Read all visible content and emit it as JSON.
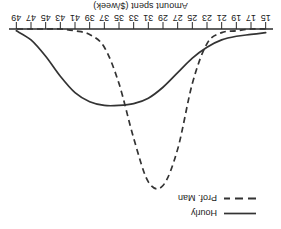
{
  "chart_data": {
    "type": "line",
    "title": "",
    "xlabel": "Amount spent ($/week)",
    "ylabel": "",
    "xlim": [
      14,
      50
    ],
    "ylim": [
      0,
      1
    ],
    "grid": false,
    "orientation": "rotated-180",
    "legend_position": "upper-left",
    "tick_labels": [
      "15",
      "17",
      "19",
      "21",
      "23",
      "25",
      "27",
      "29",
      "31",
      "33",
      "35",
      "37",
      "39",
      "41",
      "43",
      "45",
      "47",
      "49"
    ],
    "tick_values": [
      15,
      17,
      19,
      21,
      23,
      25,
      27,
      29,
      31,
      33,
      35,
      37,
      39,
      41,
      43,
      45,
      47,
      49
    ],
    "series": [
      {
        "name": "Hourly",
        "style": "solid",
        "color": "#333333",
        "peak_x": 38,
        "peak_y": 0.42,
        "x": [
          15,
          17,
          19,
          21,
          23,
          25,
          27,
          29,
          31,
          33,
          35,
          37,
          39,
          41,
          43,
          45,
          47,
          49
        ],
        "values": [
          0.02,
          0.03,
          0.04,
          0.06,
          0.1,
          0.16,
          0.24,
          0.32,
          0.38,
          0.41,
          0.42,
          0.42,
          0.4,
          0.35,
          0.26,
          0.15,
          0.06,
          0.01
        ]
      },
      {
        "name": "Prof. Man",
        "style": "dashed",
        "color": "#333333",
        "peak_x": 30,
        "peak_y": 0.86,
        "x": [
          15,
          17,
          19,
          21,
          23,
          25,
          27,
          29,
          31,
          33,
          35,
          37,
          39,
          41,
          43,
          45,
          47,
          49
        ],
        "values": [
          0.0,
          0.0,
          0.01,
          0.02,
          0.08,
          0.3,
          0.66,
          0.86,
          0.84,
          0.6,
          0.3,
          0.1,
          0.03,
          0.01,
          0.0,
          0.0,
          0.0,
          0.0
        ]
      }
    ]
  },
  "axis": {
    "title": "Amount spent ($/week)"
  },
  "legend": {
    "entries": [
      {
        "label": "Hourly",
        "style": "solid"
      },
      {
        "label": "Prof. Man",
        "style": "dashed"
      }
    ]
  }
}
